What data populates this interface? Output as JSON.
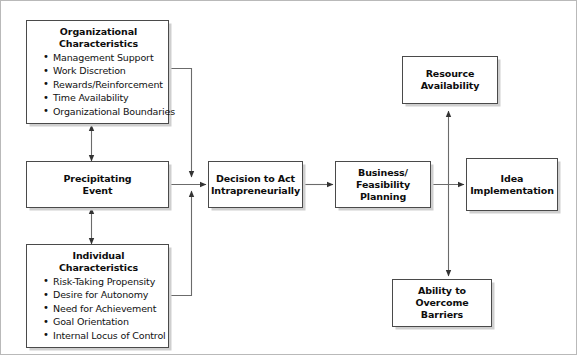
{
  "diagram": {
    "colors": {
      "box_border": "#4a4a4a",
      "box_fill": "#ffffff",
      "shadow": "#cfcfcf",
      "connector": "#555555",
      "frame": "#b9b9b9",
      "text": "#111111"
    },
    "nodes": [
      {
        "id": "organizational-characteristics",
        "title_line1": "Organizational",
        "title_line2": "Characteristics",
        "items": [
          "Management Support",
          "Work Discretion",
          "Rewards/Reinforcement",
          "Time Availability",
          "Organizational Boundaries"
        ]
      },
      {
        "id": "precipitating-event",
        "title_line1": "Precipitating",
        "title_line2": "Event",
        "items": []
      },
      {
        "id": "individual-characteristics",
        "title_line1": "Individual",
        "title_line2": "Characteristics",
        "items": [
          "Risk-Taking Propensity",
          "Desire for Autonomy",
          "Need for Achievement",
          "Goal Orientation",
          "Internal Locus of Control"
        ]
      },
      {
        "id": "decision-to-act",
        "title_line1": "Decision to Act",
        "title_line2": "Intrapreneurially",
        "items": []
      },
      {
        "id": "business-feasibility-planning",
        "title_line1": "Business/",
        "title_line2": "Feasibility Planning",
        "items": []
      },
      {
        "id": "idea-implementation",
        "title_line1": "Idea",
        "title_line2": "Implementation",
        "items": []
      },
      {
        "id": "resource-availability",
        "title_line1": "Resource",
        "title_line2": "Availability",
        "items": []
      },
      {
        "id": "ability-to-overcome-barriers",
        "title_line1": "Ability to",
        "title_line2": "Overcome Barriers",
        "items": []
      }
    ],
    "connectors": [
      {
        "from": "organizational-characteristics",
        "to": "precipitating-event",
        "type": "bidirectional-vertical"
      },
      {
        "from": "precipitating-event",
        "to": "individual-characteristics",
        "type": "bidirectional-vertical"
      },
      {
        "from": "organizational-characteristics",
        "to": "decision-to-act",
        "type": "elbow-arrow"
      },
      {
        "from": "individual-characteristics",
        "to": "decision-to-act",
        "type": "elbow-arrow"
      },
      {
        "from": "precipitating-event",
        "to": "decision-to-act",
        "type": "arrow"
      },
      {
        "from": "decision-to-act",
        "to": "business-feasibility-planning",
        "type": "arrow"
      },
      {
        "from": "business-feasibility-planning",
        "to": "idea-implementation",
        "type": "arrow"
      },
      {
        "from": "resource-availability",
        "to": "ability-to-overcome-barriers",
        "type": "bidirectional-vertical"
      }
    ]
  }
}
